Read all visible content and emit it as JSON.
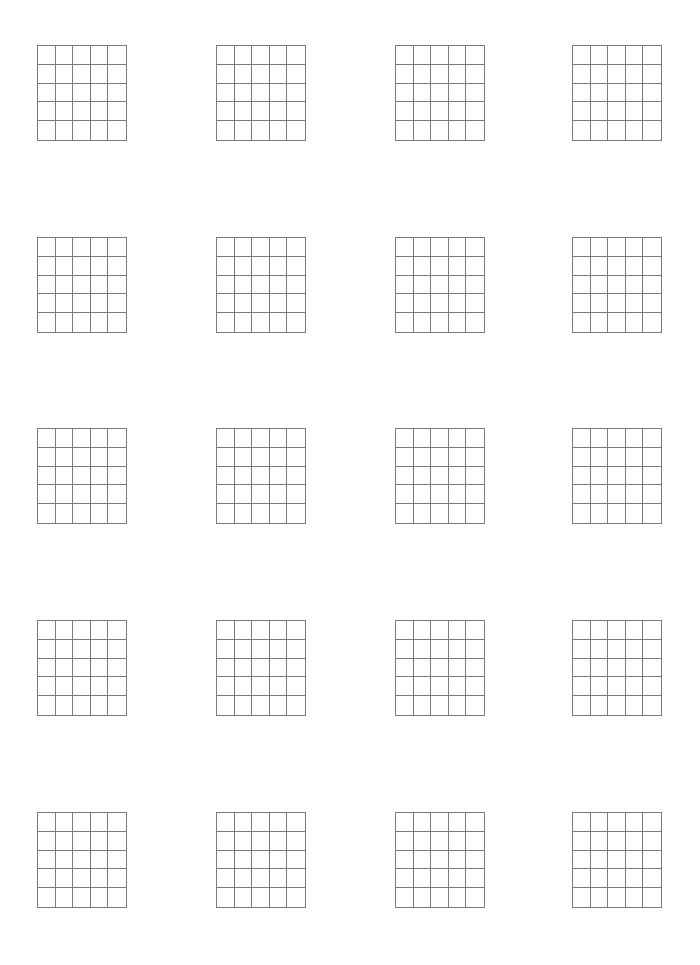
{
  "page": {
    "title": "",
    "background": "#ffffff",
    "line_color": "#7a7a7a"
  },
  "layout": {
    "grid_rows": 5,
    "grid_cols": 4,
    "cells_per_grid": {
      "rows": 5,
      "cols": 5
    },
    "column_x": [
      37,
      216,
      395,
      572
    ],
    "row_y": [
      45,
      237,
      428,
      620,
      812
    ],
    "grid_size": {
      "width": 90,
      "height": 96
    }
  },
  "grids": [
    {
      "row": 1,
      "col": 1
    },
    {
      "row": 1,
      "col": 2
    },
    {
      "row": 1,
      "col": 3
    },
    {
      "row": 1,
      "col": 4
    },
    {
      "row": 2,
      "col": 1
    },
    {
      "row": 2,
      "col": 2
    },
    {
      "row": 2,
      "col": 3
    },
    {
      "row": 2,
      "col": 4
    },
    {
      "row": 3,
      "col": 1
    },
    {
      "row": 3,
      "col": 2
    },
    {
      "row": 3,
      "col": 3
    },
    {
      "row": 3,
      "col": 4
    },
    {
      "row": 4,
      "col": 1
    },
    {
      "row": 4,
      "col": 2
    },
    {
      "row": 4,
      "col": 3
    },
    {
      "row": 4,
      "col": 4
    },
    {
      "row": 5,
      "col": 1
    },
    {
      "row": 5,
      "col": 2
    },
    {
      "row": 5,
      "col": 3
    },
    {
      "row": 5,
      "col": 4
    }
  ]
}
